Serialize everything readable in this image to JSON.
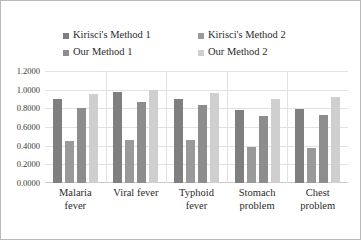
{
  "chart_data": {
    "type": "bar",
    "title": "",
    "subtitle": "",
    "xlabel": "",
    "ylabel": "",
    "grid": true,
    "legend_position": "top",
    "categories": [
      "Malaria fever",
      "Viral fever",
      "Typhoid fever",
      "Stomach problem",
      "Chest problem"
    ],
    "category_lines": [
      [
        "Malaria",
        "fever"
      ],
      [
        "Viral fever",
        ""
      ],
      [
        "Typhoid",
        "fever"
      ],
      [
        "Stomach",
        "problem"
      ],
      [
        "Chest",
        "problem"
      ]
    ],
    "ylim": [
      0.0,
      1.2
    ],
    "ytick_values": [
      0.0,
      0.2,
      0.4,
      0.6,
      0.8,
      1.0,
      1.2
    ],
    "ytick_labels": [
      "0.0000",
      "0.2000",
      "0.4000",
      "0.6000",
      "0.8000",
      "1.0000",
      "1.2000"
    ],
    "series": [
      {
        "name": "Kirisci's Method 1",
        "color": "#7f7f7f",
        "values": [
          0.9,
          0.97,
          0.9,
          0.78,
          0.79
        ]
      },
      {
        "name": "Kirisci's Method 2",
        "color": "#9a9a9a",
        "values": [
          0.45,
          0.46,
          0.46,
          0.39,
          0.38
        ]
      },
      {
        "name": "Our Method 1",
        "color": "#8d8d8d",
        "values": [
          0.8,
          0.87,
          0.84,
          0.72,
          0.73
        ]
      },
      {
        "name": "Our Method 2",
        "color": "#cfcfcf",
        "values": [
          0.95,
          1.0,
          0.96,
          0.9,
          0.92
        ]
      }
    ]
  },
  "legend": {
    "items": [
      {
        "label": "Kirisci's Method 1",
        "color": "#7f7f7f"
      },
      {
        "label": "Kirisci's Method 2",
        "color": "#9a9a9a"
      },
      {
        "label": "Our Method 1",
        "color": "#8d8d8d"
      },
      {
        "label": "Our Method 2",
        "color": "#cfcfcf"
      }
    ]
  }
}
